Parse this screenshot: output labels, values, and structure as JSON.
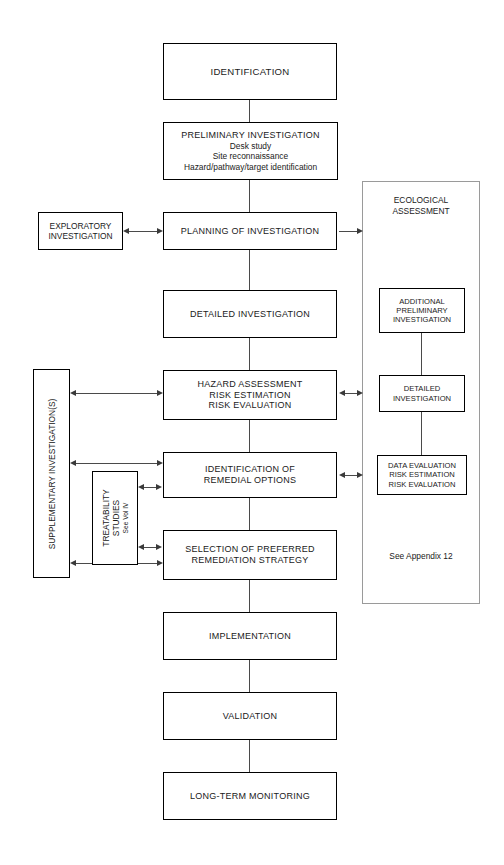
{
  "diagram": {
    "main_flow": [
      {
        "id": "identification",
        "lines": [
          "IDENTIFICATION"
        ]
      },
      {
        "id": "preliminary-investigation",
        "lines": [
          "PRELIMINARY INVESTIGATION",
          "Desk study",
          "Site reconnaissance",
          "Hazard/pathway/target identification"
        ]
      },
      {
        "id": "planning-of-investigation",
        "lines": [
          "PLANNING OF INVESTIGATION"
        ]
      },
      {
        "id": "detailed-investigation",
        "lines": [
          "DETAILED INVESTIGATION"
        ]
      },
      {
        "id": "hazard-assessment",
        "lines": [
          "HAZARD ASSESSMENT",
          "RISK ESTIMATION",
          "RISK EVALUATION"
        ]
      },
      {
        "id": "identification-of-remedial-options",
        "lines": [
          "IDENTIFICATION OF",
          "REMEDIAL OPTIONS"
        ]
      },
      {
        "id": "selection-of-preferred-remediation-strategy",
        "lines": [
          "SELECTION OF PREFERRED",
          "REMEDIATION STRATEGY"
        ]
      },
      {
        "id": "implementation",
        "lines": [
          "IMPLEMENTATION"
        ]
      },
      {
        "id": "validation",
        "lines": [
          "VALIDATION"
        ]
      },
      {
        "id": "long-term-monitoring",
        "lines": [
          "LONG-TERM MONITORING"
        ]
      }
    ],
    "side_boxes": {
      "exploratory": {
        "lines": [
          "EXPLORATORY",
          "INVESTIGATION"
        ]
      },
      "supplementary": {
        "label": "SUPPLEMENTARY INVESTIGATION(S)"
      },
      "treatability": {
        "line1": "TREATABILITY",
        "line2": "STUDIES",
        "line3": "See Vol IV"
      }
    },
    "ecological_panel": {
      "title_line1": "ECOLOGICAL",
      "title_line2": "ASSESSMENT",
      "note": "See Appendix 12",
      "boxes": [
        {
          "id": "eco-additional-preliminary-investigation",
          "lines": [
            "ADDITIONAL",
            "PRELIMINARY",
            "INVESTIGATION"
          ]
        },
        {
          "id": "eco-detailed-investigation",
          "lines": [
            "DETAILED",
            "INVESTIGATION"
          ]
        },
        {
          "id": "eco-data-evaluation",
          "lines": [
            "DATA EVALUATION",
            "RISK ESTIMATION",
            "RISK EVALUATION"
          ]
        }
      ]
    },
    "colors": {
      "box_border": "#000000",
      "panel_border": "#9a9a9a",
      "connector": "#4a4a4a",
      "background": "#ffffff",
      "text": "#1a1a1a"
    }
  }
}
